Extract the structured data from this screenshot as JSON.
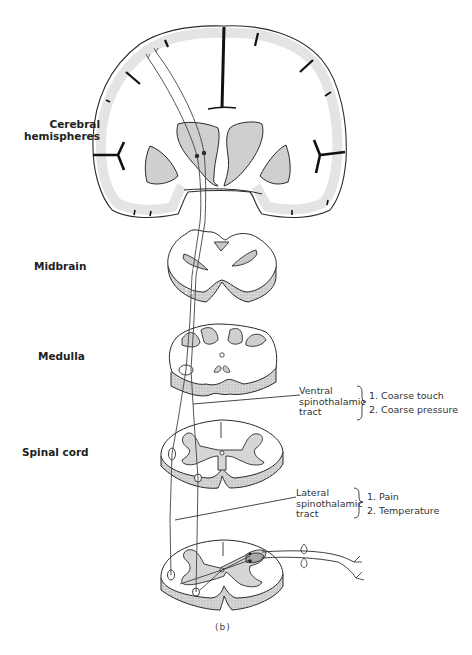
{
  "figure": {
    "caption": "(b)",
    "levels": [
      {
        "id": "cerebral",
        "label_line1": "Cerebral",
        "label_line2": "hemispheres"
      },
      {
        "id": "midbrain",
        "label": "Midbrain"
      },
      {
        "id": "medulla",
        "label": "Medulla"
      },
      {
        "id": "spinal",
        "label": "Spinal cord"
      }
    ],
    "tracts": [
      {
        "name_line1": "Ventral",
        "name_line2": "spinothalamic",
        "name_line3": "tract",
        "functions": [
          "1. Coarse touch",
          "2. Coarse pressure"
        ]
      },
      {
        "name_line1": "Lateral",
        "name_line2": "spinothalamic",
        "name_line3": "tract",
        "functions": [
          "1. Pain",
          "2. Temperature"
        ]
      }
    ],
    "colors": {
      "line": "#2a2a2a",
      "grey_matter": "#cfcfcf",
      "cortex_shade": "#e9e9e9",
      "stipple": "#bdbdbd"
    }
  }
}
